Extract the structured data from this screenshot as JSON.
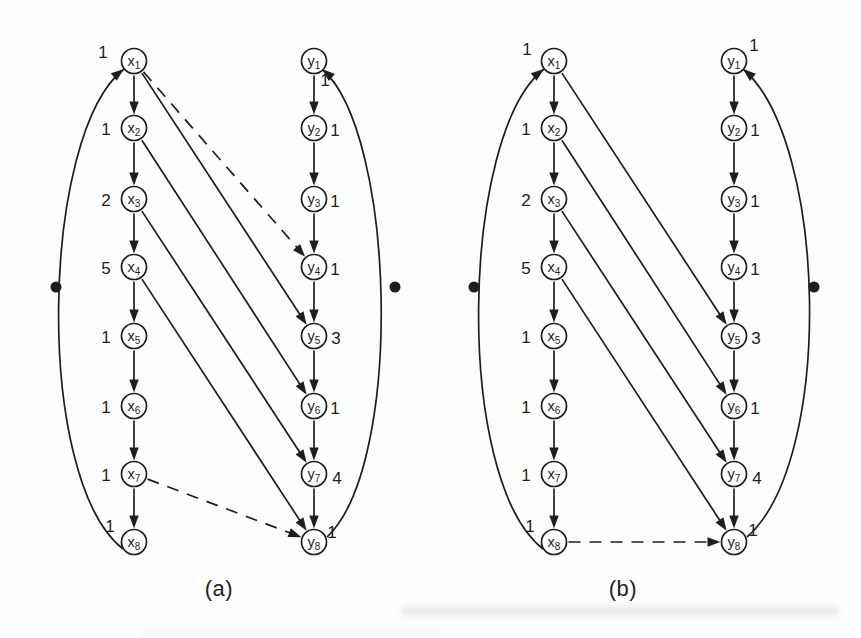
{
  "figure": {
    "background": "#fdfdfd",
    "ink": "#1e1e1e",
    "node_fill": "#ffffff",
    "node_radius": 12.5,
    "dot_radius": 5.5,
    "diagrams": [
      {
        "key": "a",
        "caption": "(a)",
        "nodes": [
          {
            "id": "x1",
            "label": "x",
            "sub": "1",
            "cx": 134,
            "cy": 61,
            "value": "1",
            "vdx": -31,
            "vdy": -9
          },
          {
            "id": "x2",
            "label": "x",
            "sub": "2",
            "cx": 134,
            "cy": 128,
            "value": "1",
            "vdx": -28,
            "vdy": 1
          },
          {
            "id": "x3",
            "label": "x",
            "sub": "3",
            "cx": 134,
            "cy": 199,
            "value": "2",
            "vdx": -28,
            "vdy": 1
          },
          {
            "id": "x4",
            "label": "x",
            "sub": "4",
            "cx": 134,
            "cy": 267,
            "value": "5",
            "vdx": -28,
            "vdy": 1
          },
          {
            "id": "x5",
            "label": "x",
            "sub": "5",
            "cx": 134,
            "cy": 336,
            "value": "1",
            "vdx": -28,
            "vdy": 1
          },
          {
            "id": "x6",
            "label": "x",
            "sub": "6",
            "cx": 134,
            "cy": 406,
            "value": "1",
            "vdx": -28,
            "vdy": 1
          },
          {
            "id": "x7",
            "label": "x",
            "sub": "7",
            "cx": 134,
            "cy": 474,
            "value": "1",
            "vdx": -28,
            "vdy": 1
          },
          {
            "id": "x8",
            "label": "x",
            "sub": "8",
            "cx": 134,
            "cy": 542,
            "value": "1",
            "vdx": -24,
            "vdy": -16
          },
          {
            "id": "y1",
            "label": "y",
            "sub": "1",
            "cx": 314,
            "cy": 61,
            "value": "1",
            "vdx": 11,
            "vdy": 19
          },
          {
            "id": "y2",
            "label": "y",
            "sub": "2",
            "cx": 314,
            "cy": 128,
            "value": "1",
            "vdx": 21,
            "vdy": 2
          },
          {
            "id": "y3",
            "label": "y",
            "sub": "3",
            "cx": 314,
            "cy": 199,
            "value": "1",
            "vdx": 21,
            "vdy": 2
          },
          {
            "id": "y4",
            "label": "y",
            "sub": "4",
            "cx": 314,
            "cy": 267,
            "value": "1",
            "vdx": 21,
            "vdy": 2
          },
          {
            "id": "y5",
            "label": "y",
            "sub": "5",
            "cx": 314,
            "cy": 336,
            "value": "3",
            "vdx": 22,
            "vdy": 2
          },
          {
            "id": "y6",
            "label": "y",
            "sub": "6",
            "cx": 314,
            "cy": 406,
            "value": "1",
            "vdx": 21,
            "vdy": 2
          },
          {
            "id": "y7",
            "label": "y",
            "sub": "7",
            "cx": 314,
            "cy": 474,
            "value": "4",
            "vdx": 23,
            "vdy": 4
          },
          {
            "id": "y8",
            "label": "y",
            "sub": "8",
            "cx": 314,
            "cy": 542,
            "value": "1",
            "vdx": 18,
            "vdy": -10
          }
        ],
        "edges": [
          {
            "from": "x1",
            "to": "x2",
            "style": "solid"
          },
          {
            "from": "x2",
            "to": "x3",
            "style": "solid"
          },
          {
            "from": "x3",
            "to": "x4",
            "style": "solid"
          },
          {
            "from": "x4",
            "to": "x5",
            "style": "solid"
          },
          {
            "from": "x5",
            "to": "x6",
            "style": "solid"
          },
          {
            "from": "x6",
            "to": "x7",
            "style": "solid"
          },
          {
            "from": "x7",
            "to": "x8",
            "style": "solid"
          },
          {
            "from": "y1",
            "to": "y2",
            "style": "solid"
          },
          {
            "from": "y2",
            "to": "y3",
            "style": "solid"
          },
          {
            "from": "y3",
            "to": "y4",
            "style": "solid"
          },
          {
            "from": "y4",
            "to": "y5",
            "style": "solid"
          },
          {
            "from": "y5",
            "to": "y6",
            "style": "solid"
          },
          {
            "from": "y6",
            "to": "y7",
            "style": "solid"
          },
          {
            "from": "y7",
            "to": "y8",
            "style": "solid"
          },
          {
            "from": "x1",
            "to": "y5",
            "style": "solid"
          },
          {
            "from": "x2",
            "to": "y6",
            "style": "solid"
          },
          {
            "from": "x3",
            "to": "y7",
            "style": "solid"
          },
          {
            "from": "x4",
            "to": "y8",
            "style": "solid"
          },
          {
            "from": "x1",
            "to": "y4",
            "style": "dashed"
          },
          {
            "from": "x7",
            "to": "y8",
            "style": "dashed"
          }
        ],
        "curves": [
          {
            "from": "x8",
            "to": "x1",
            "pts": [
              123,
              549,
              33,
              478,
              41,
              133,
              124,
              69
            ]
          },
          {
            "from": "y8",
            "to": "y1",
            "pts": [
              327,
              537,
              404,
              465,
              396,
              133,
              322,
              69
            ]
          }
        ],
        "dots": [
          {
            "x": 56,
            "y": 287
          },
          {
            "x": 395,
            "y": 287
          }
        ]
      },
      {
        "key": "b",
        "caption": "(b)",
        "nodes": [
          {
            "id": "x1",
            "label": "x",
            "sub": "1",
            "cx": 554,
            "cy": 61,
            "value": "1",
            "vdx": -27,
            "vdy": -12
          },
          {
            "id": "x2",
            "label": "x",
            "sub": "2",
            "cx": 554,
            "cy": 128,
            "value": "1",
            "vdx": -28,
            "vdy": 1
          },
          {
            "id": "x3",
            "label": "x",
            "sub": "3",
            "cx": 554,
            "cy": 199,
            "value": "2",
            "vdx": -28,
            "vdy": 1
          },
          {
            "id": "x4",
            "label": "x",
            "sub": "4",
            "cx": 554,
            "cy": 267,
            "value": "5",
            "vdx": -28,
            "vdy": 1
          },
          {
            "id": "x5",
            "label": "x",
            "sub": "5",
            "cx": 554,
            "cy": 336,
            "value": "1",
            "vdx": -28,
            "vdy": 1
          },
          {
            "id": "x6",
            "label": "x",
            "sub": "6",
            "cx": 554,
            "cy": 406,
            "value": "1",
            "vdx": -28,
            "vdy": 1
          },
          {
            "id": "x7",
            "label": "x",
            "sub": "7",
            "cx": 554,
            "cy": 474,
            "value": "1",
            "vdx": -28,
            "vdy": 1
          },
          {
            "id": "x8",
            "label": "x",
            "sub": "8",
            "cx": 554,
            "cy": 542,
            "value": "1",
            "vdx": -24,
            "vdy": -16
          },
          {
            "id": "y1",
            "label": "y",
            "sub": "1",
            "cx": 734,
            "cy": 61,
            "value": "1",
            "vdx": 20,
            "vdy": -16
          },
          {
            "id": "y2",
            "label": "y",
            "sub": "2",
            "cx": 734,
            "cy": 128,
            "value": "1",
            "vdx": 21,
            "vdy": 2
          },
          {
            "id": "y3",
            "label": "y",
            "sub": "3",
            "cx": 734,
            "cy": 199,
            "value": "1",
            "vdx": 21,
            "vdy": 2
          },
          {
            "id": "y4",
            "label": "y",
            "sub": "4",
            "cx": 734,
            "cy": 267,
            "value": "1",
            "vdx": 21,
            "vdy": 2
          },
          {
            "id": "y5",
            "label": "y",
            "sub": "5",
            "cx": 734,
            "cy": 336,
            "value": "3",
            "vdx": 22,
            "vdy": 2
          },
          {
            "id": "y6",
            "label": "y",
            "sub": "6",
            "cx": 734,
            "cy": 406,
            "value": "1",
            "vdx": 21,
            "vdy": 2
          },
          {
            "id": "y7",
            "label": "y",
            "sub": "7",
            "cx": 734,
            "cy": 474,
            "value": "4",
            "vdx": 23,
            "vdy": 4
          },
          {
            "id": "y8",
            "label": "y",
            "sub": "8",
            "cx": 734,
            "cy": 542,
            "value": "1",
            "vdx": 19,
            "vdy": -12
          }
        ],
        "edges": [
          {
            "from": "x1",
            "to": "x2",
            "style": "solid"
          },
          {
            "from": "x2",
            "to": "x3",
            "style": "solid"
          },
          {
            "from": "x3",
            "to": "x4",
            "style": "solid"
          },
          {
            "from": "x4",
            "to": "x5",
            "style": "solid"
          },
          {
            "from": "x5",
            "to": "x6",
            "style": "solid"
          },
          {
            "from": "x6",
            "to": "x7",
            "style": "solid"
          },
          {
            "from": "x7",
            "to": "x8",
            "style": "solid"
          },
          {
            "from": "y1",
            "to": "y2",
            "style": "solid"
          },
          {
            "from": "y2",
            "to": "y3",
            "style": "solid"
          },
          {
            "from": "y3",
            "to": "y4",
            "style": "solid"
          },
          {
            "from": "y4",
            "to": "y5",
            "style": "solid"
          },
          {
            "from": "y5",
            "to": "y6",
            "style": "solid"
          },
          {
            "from": "y6",
            "to": "y7",
            "style": "solid"
          },
          {
            "from": "y7",
            "to": "y8",
            "style": "solid"
          },
          {
            "from": "x1",
            "to": "y5",
            "style": "solid"
          },
          {
            "from": "x2",
            "to": "y6",
            "style": "solid"
          },
          {
            "from": "x3",
            "to": "y7",
            "style": "solid"
          },
          {
            "from": "x4",
            "to": "y8",
            "style": "solid"
          },
          {
            "from": "x8",
            "to": "y8",
            "style": "dashed"
          }
        ],
        "curves": [
          {
            "from": "x8",
            "to": "x1",
            "pts": [
              543,
              549,
              453,
              478,
              461,
              133,
              544,
              69
            ]
          },
          {
            "from": "y8",
            "to": "y1",
            "pts": [
              747,
              537,
              835,
              460,
              827,
              140,
              743,
              69
            ]
          }
        ],
        "dots": [
          {
            "x": 474,
            "y": 287
          },
          {
            "x": 814,
            "y": 287
          }
        ]
      }
    ]
  }
}
